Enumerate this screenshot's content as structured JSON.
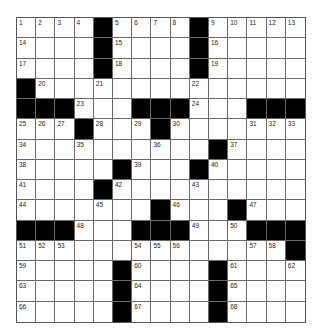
{
  "puzzle": {
    "rows": 15,
    "cols": 15,
    "colors": {
      "black": "#000000",
      "white": "#ffffff",
      "line": "#6a6a6a"
    },
    "layout": [
      "....#....#.....",
      "....#....#.....",
      "....#....#.....",
      "#..............",
      "###...###...###",
      "...#...#.......",
      "..........#....",
      ".....#...#.....",
      "....#..........",
      ".......#...#...",
      "###...###...###",
      "..............#",
      ".....#....#....",
      ".....#....#....",
      ".....#....#...."
    ],
    "numbers": [
      {
        "r": 0,
        "c": 0,
        "n": "1"
      },
      {
        "r": 0,
        "c": 1,
        "n": "2"
      },
      {
        "r": 0,
        "c": 2,
        "n": "3"
      },
      {
        "r": 0,
        "c": 3,
        "n": "4"
      },
      {
        "r": 0,
        "c": 5,
        "n": "5"
      },
      {
        "r": 0,
        "c": 6,
        "n": "6"
      },
      {
        "r": 0,
        "c": 7,
        "n": "7"
      },
      {
        "r": 0,
        "c": 8,
        "n": "8"
      },
      {
        "r": 0,
        "c": 10,
        "n": "9"
      },
      {
        "r": 0,
        "c": 11,
        "n": "10"
      },
      {
        "r": 0,
        "c": 12,
        "n": "11"
      },
      {
        "r": 0,
        "c": 13,
        "n": "12"
      },
      {
        "r": 0,
        "c": 14,
        "n": "13"
      },
      {
        "r": 1,
        "c": 0,
        "n": "14"
      },
      {
        "r": 1,
        "c": 5,
        "n": "15"
      },
      {
        "r": 1,
        "c": 10,
        "n": "16"
      },
      {
        "r": 2,
        "c": 0,
        "n": "17"
      },
      {
        "r": 2,
        "c": 5,
        "n": "18"
      },
      {
        "r": 2,
        "c": 10,
        "n": "19"
      },
      {
        "r": 3,
        "c": 1,
        "n": "20"
      },
      {
        "r": 3,
        "c": 4,
        "n": "21"
      },
      {
        "r": 3,
        "c": 9,
        "n": "22"
      },
      {
        "r": 4,
        "c": 3,
        "n": "23"
      },
      {
        "r": 4,
        "c": 9,
        "n": "24"
      },
      {
        "r": 5,
        "c": 0,
        "n": "25"
      },
      {
        "r": 5,
        "c": 1,
        "n": "26"
      },
      {
        "r": 5,
        "c": 2,
        "n": "27"
      },
      {
        "r": 5,
        "c": 4,
        "n": "28"
      },
      {
        "r": 5,
        "c": 6,
        "n": "29"
      },
      {
        "r": 5,
        "c": 8,
        "n": "30"
      },
      {
        "r": 5,
        "c": 12,
        "n": "31"
      },
      {
        "r": 5,
        "c": 13,
        "n": "32"
      },
      {
        "r": 5,
        "c": 14,
        "n": "33"
      },
      {
        "r": 6,
        "c": 0,
        "n": "34"
      },
      {
        "r": 6,
        "c": 3,
        "n": "35"
      },
      {
        "r": 6,
        "c": 7,
        "n": "36"
      },
      {
        "r": 6,
        "c": 11,
        "n": "37"
      },
      {
        "r": 7,
        "c": 0,
        "n": "38"
      },
      {
        "r": 7,
        "c": 6,
        "n": "39"
      },
      {
        "r": 7,
        "c": 10,
        "n": "40"
      },
      {
        "r": 8,
        "c": 0,
        "n": "41"
      },
      {
        "r": 8,
        "c": 5,
        "n": "42"
      },
      {
        "r": 8,
        "c": 9,
        "n": "43"
      },
      {
        "r": 9,
        "c": 0,
        "n": "44"
      },
      {
        "r": 9,
        "c": 4,
        "n": "45"
      },
      {
        "r": 9,
        "c": 8,
        "n": "46"
      },
      {
        "r": 9,
        "c": 12,
        "n": "47"
      },
      {
        "r": 10,
        "c": 3,
        "n": "48"
      },
      {
        "r": 10,
        "c": 9,
        "n": "49"
      },
      {
        "r": 10,
        "c": 11,
        "n": "50"
      },
      {
        "r": 11,
        "c": 0,
        "n": "51"
      },
      {
        "r": 11,
        "c": 1,
        "n": "52"
      },
      {
        "r": 11,
        "c": 2,
        "n": "53"
      },
      {
        "r": 11,
        "c": 6,
        "n": "54"
      },
      {
        "r": 11,
        "c": 7,
        "n": "55"
      },
      {
        "r": 11,
        "c": 8,
        "n": "56"
      },
      {
        "r": 11,
        "c": 12,
        "n": "57"
      },
      {
        "r": 11,
        "c": 13,
        "n": "58"
      },
      {
        "r": 12,
        "c": 0,
        "n": "59"
      },
      {
        "r": 12,
        "c": 6,
        "n": "60"
      },
      {
        "r": 12,
        "c": 11,
        "n": "61"
      },
      {
        "r": 12,
        "c": 14,
        "n": "62"
      },
      {
        "r": 13,
        "c": 0,
        "n": "63"
      },
      {
        "r": 13,
        "c": 6,
        "n": "64"
      },
      {
        "r": 13,
        "c": 11,
        "n": "65"
      },
      {
        "r": 14,
        "c": 0,
        "n": "66"
      },
      {
        "r": 14,
        "c": 6,
        "n": "67"
      },
      {
        "r": 14,
        "c": 11,
        "n": "68"
      }
    ]
  }
}
